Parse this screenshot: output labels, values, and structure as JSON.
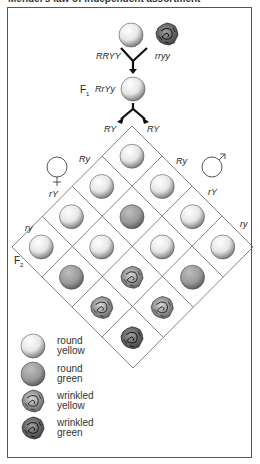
{
  "title": "Mendel's law of independent assortment",
  "parents": {
    "p1_genotype": "RRYY",
    "p2_genotype": "rryy",
    "p1_phenotype": "round yellow",
    "p2_phenotype": "wrinkled green"
  },
  "f1": {
    "label": "F",
    "subscript": "1",
    "genotype": "RrYy",
    "phenotype": "round yellow"
  },
  "f2": {
    "label": "F",
    "subscript": "2"
  },
  "gametes": {
    "female_symbol": "♀",
    "male_symbol": "♂",
    "female": [
      "RY",
      "Ry",
      "rY",
      "ry"
    ],
    "male": [
      "RY",
      "Ry",
      "rY",
      "ry"
    ]
  },
  "grid": [
    [
      "round-yellow",
      "round-yellow",
      "round-yellow",
      "round-yellow"
    ],
    [
      "round-yellow",
      "round-green",
      "round-yellow",
      "round-green"
    ],
    [
      "round-yellow",
      "round-yellow",
      "wrinkled-yellow",
      "wrinkled-yellow"
    ],
    [
      "round-yellow",
      "round-green",
      "wrinkled-yellow",
      "wrinkled-green"
    ]
  ],
  "legend": [
    {
      "key": "round-yellow",
      "line1": "round",
      "line2": "yellow"
    },
    {
      "key": "round-green",
      "line1": "round",
      "line2": "green"
    },
    {
      "key": "wrinkled-yellow",
      "line1": "wrinkled",
      "line2": "yellow"
    },
    {
      "key": "wrinkled-green",
      "line1": "wrinkled",
      "line2": "green"
    }
  ],
  "colors": {
    "frame": "#555555",
    "line": "#666666",
    "round_yellow": "#f2f2f2",
    "round_green": "#9a9a9a",
    "wrinkled_yellow": "#8a8a8a",
    "wrinkled_green": "#5e5e5e"
  }
}
